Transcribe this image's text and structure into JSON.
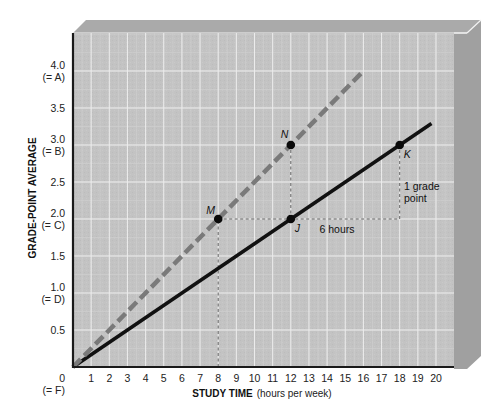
{
  "chart_data": {
    "type": "line",
    "title": "",
    "xlabel": "STUDY TIME",
    "xlabel_sub": "(hours per week)",
    "ylabel": "GRADE-POINT AVERAGE",
    "xlim": [
      0,
      20
    ],
    "ylim": [
      0,
      4.0
    ],
    "grid": true,
    "legend": null,
    "x_ticks": [
      "1",
      "2",
      "3",
      "4",
      "5",
      "6",
      "7",
      "8",
      "9",
      "10",
      "11",
      "12",
      "13",
      "14",
      "15",
      "16",
      "17",
      "18",
      "19",
      "20"
    ],
    "y_ticks": [
      {
        "value": 0,
        "label": "0",
        "sub": "(= F)"
      },
      {
        "value": 0.5,
        "label": "0.5",
        "sub": ""
      },
      {
        "value": 1.0,
        "label": "1.0",
        "sub": "(= D)"
      },
      {
        "value": 1.5,
        "label": "1.5",
        "sub": ""
      },
      {
        "value": 2.0,
        "label": "2.0",
        "sub": "(= C)"
      },
      {
        "value": 2.5,
        "label": "2.5",
        "sub": ""
      },
      {
        "value": 3.0,
        "label": "3.0",
        "sub": "(= B)"
      },
      {
        "value": 3.5,
        "label": "3.5",
        "sub": ""
      },
      {
        "value": 4.0,
        "label": "4.0",
        "sub": "(= A)"
      }
    ],
    "series": [
      {
        "name": "solid",
        "style": "solid",
        "color": "#111111",
        "points": [
          [
            0,
            0
          ],
          [
            19.75,
            3.29
          ]
        ]
      },
      {
        "name": "dashed",
        "style": "dashed",
        "color": "#7a7a7a",
        "points": [
          [
            0,
            0
          ],
          [
            16,
            4.0
          ]
        ]
      }
    ],
    "points": [
      {
        "label": "M",
        "x": 8,
        "y": 2.0,
        "series": "dashed"
      },
      {
        "label": "N",
        "x": 12,
        "y": 3.0,
        "series": "dashed"
      },
      {
        "label": "J",
        "x": 12,
        "y": 2.0,
        "series": "solid"
      },
      {
        "label": "K",
        "x": 18,
        "y": 3.0,
        "series": "solid"
      }
    ],
    "annotations": [
      {
        "text": "6 hours",
        "x": 15,
        "y": 2.0,
        "note": "horizontal run from J to K"
      },
      {
        "text": "1 grade point",
        "lines": [
          "1 grade",
          "point"
        ],
        "x": 18,
        "y": 2.5,
        "note": "vertical rise at x=18"
      }
    ],
    "guides": [
      {
        "from": [
          8,
          0
        ],
        "to": [
          8,
          2.0
        ]
      },
      {
        "from": [
          8,
          2.0
        ],
        "to": [
          18,
          2.0
        ]
      },
      {
        "from": [
          12,
          2.0
        ],
        "to": [
          12,
          3.0
        ]
      },
      {
        "from": [
          18,
          2.0
        ],
        "to": [
          18,
          3.0
        ]
      }
    ]
  },
  "colors": {
    "plot_bg": "#c3c3c3",
    "grid_major": "#ececec",
    "grid_minor": "#d0d0d0",
    "top_face": "#a9a9a9",
    "side_face": "#9e9e9e",
    "axis": "#1a1a1a"
  }
}
